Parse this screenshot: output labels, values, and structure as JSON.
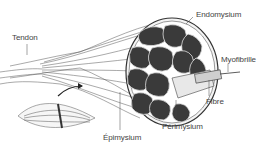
{
  "figure": {
    "labels": {
      "tendon": "Tendon",
      "endomysium": "Endomysium",
      "myofibrille": "Myofibrille",
      "fibre": "Fibre",
      "perimysium": "Périmysium",
      "epimysium": "Épimysium"
    },
    "colors": {
      "ink": "#333333",
      "fascicle_fill": "#3a3a3a",
      "background": "#ffffff"
    }
  }
}
